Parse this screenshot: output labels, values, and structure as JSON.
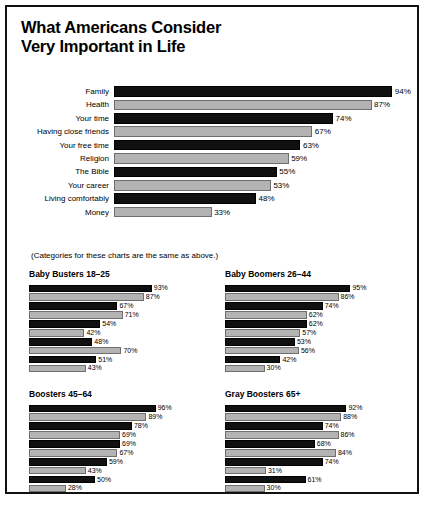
{
  "poster": {
    "title_line1": "What Americans Consider",
    "title_line2": "Very Important in Life",
    "note": "(Categories for these charts are the same as above.)"
  },
  "colors": {
    "dark_bar": "#101010",
    "light_bar": "#b3b3b3",
    "frame": "#111111",
    "background": "#ffffff",
    "text": "#000000"
  },
  "chart_data": [
    {
      "type": "bar",
      "title": "What Americans Consider Very Important in Life",
      "orientation": "horizontal",
      "xlabel": "",
      "ylabel": "",
      "xlim": [
        0,
        100
      ],
      "grid": false,
      "legend": "none",
      "categories": [
        "Family",
        "Health",
        "Your time",
        "Having close friends",
        "Your free time",
        "Religion",
        "The Bible",
        "Your career",
        "Living comfortably",
        "Money"
      ],
      "values": [
        94,
        87,
        74,
        67,
        63,
        59,
        55,
        53,
        48,
        33
      ],
      "value_labels": [
        "94%",
        "87%",
        "74%",
        "67%",
        "63%",
        "59%",
        "55%",
        "53%",
        "48%",
        "33%"
      ]
    },
    {
      "type": "bar",
      "title": "Baby Busters 18–25",
      "orientation": "horizontal",
      "xlim": [
        0,
        100
      ],
      "grid": false,
      "legend": "none",
      "categories": [
        "Family",
        "Health",
        "Your time",
        "Having close friends",
        "Your free time",
        "Religion",
        "The Bible",
        "Your career",
        "Living comfortably",
        "Money"
      ],
      "values": [
        93,
        87,
        67,
        71,
        54,
        42,
        48,
        70,
        51,
        43
      ],
      "value_labels": [
        "93%",
        "87%",
        "67%",
        "71%",
        "54%",
        "42%",
        "48%",
        "70%",
        "51%",
        "43%"
      ]
    },
    {
      "type": "bar",
      "title": "Baby Boomers 26–44",
      "orientation": "horizontal",
      "xlim": [
        0,
        100
      ],
      "grid": false,
      "legend": "none",
      "categories": [
        "Family",
        "Health",
        "Your time",
        "Having close friends",
        "Your free time",
        "Religion",
        "The Bible",
        "Your career",
        "Living comfortably",
        "Money"
      ],
      "values": [
        95,
        86,
        74,
        62,
        62,
        57,
        53,
        56,
        42,
        30
      ],
      "value_labels": [
        "95%",
        "86%",
        "74%",
        "62%",
        "62%",
        "57%",
        "53%",
        "56%",
        "42%",
        "30%"
      ]
    },
    {
      "type": "bar",
      "title": "Boosters 45–64",
      "orientation": "horizontal",
      "xlim": [
        0,
        100
      ],
      "grid": false,
      "legend": "none",
      "categories": [
        "Family",
        "Health",
        "Your time",
        "Having close friends",
        "Your free time",
        "Religion",
        "The Bible",
        "Your career",
        "Living comfortably",
        "Money"
      ],
      "values": [
        96,
        89,
        78,
        69,
        69,
        67,
        59,
        43,
        50,
        28
      ],
      "value_labels": [
        "96%",
        "89%",
        "78%",
        "69%",
        "69%",
        "67%",
        "59%",
        "43%",
        "50%",
        "28%"
      ]
    },
    {
      "type": "bar",
      "title": "Gray Boosters 65+",
      "orientation": "horizontal",
      "xlim": [
        0,
        100
      ],
      "grid": false,
      "legend": "none",
      "categories": [
        "Family",
        "Health",
        "Your time",
        "Having close friends",
        "Your free time",
        "Religion",
        "The Bible",
        "Your career",
        "Living comfortably",
        "Money"
      ],
      "values": [
        92,
        88,
        74,
        86,
        68,
        84,
        74,
        31,
        61,
        30
      ],
      "value_labels": [
        "92%",
        "88%",
        "74%",
        "86%",
        "68%",
        "84%",
        "74%",
        "31%",
        "61%",
        "30%"
      ]
    }
  ]
}
